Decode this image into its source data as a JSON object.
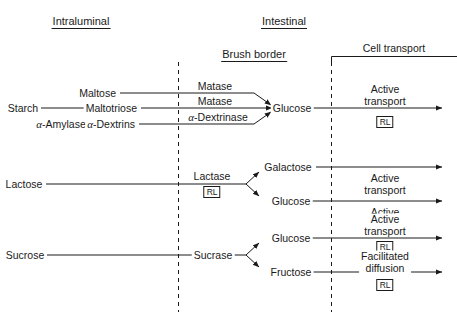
{
  "diagram": {
    "headers": {
      "intraluminal": "Intraluminal",
      "intestinal": "Intestinal",
      "brush_border": "Brush border",
      "cell_transport": "Cell transport"
    },
    "colors": {
      "line": "#1a1a1a",
      "text": "#1a1a1a",
      "background": "#ffffff"
    },
    "substrates": {
      "starch": "Starch",
      "lactose": "Lactose",
      "sucrose": "Sucrose"
    },
    "luminal_enzyme": {
      "alpha": "α",
      "name": "-Amylase"
    },
    "starch_products": {
      "maltose": "Maltose",
      "maltotriose": "Maltotriose",
      "alpha_dextrins_alpha": "α",
      "alpha_dextrins_name": "-Dextrins"
    },
    "brush_border_enzymes": {
      "maltase_1": "Matase",
      "maltase_2": "Matase",
      "alpha_dextrinase_alpha": "α",
      "alpha_dextrinase_name": "-Dextrinase",
      "lactase": "Lactase",
      "sucrase": "Sucrase"
    },
    "monosaccharides": {
      "glucose_starch": "Glucose",
      "galactose_lactose": "Galactose",
      "glucose_lactose": "Glucose",
      "glucose_sucrose": "Glucose",
      "fructose_sucrose": "Fructose"
    },
    "transport_mechanisms": {
      "starch_glucose_line1": "Active",
      "starch_glucose_line2": "transport",
      "lactose_shared_line1": "Active",
      "lactose_shared_line2": "transport",
      "lactose_glucose_line1": "Active",
      "lactose_glucose_line2": "transport",
      "sucrose_glucose_line1": "Active",
      "sucrose_glucose_line2": "transport",
      "sucrose_fructose_line1": "Facilitated",
      "sucrose_fructose_line2": "diffusion"
    },
    "rl_markers": {
      "label": "RL",
      "meaning_count": 4,
      "positions": [
        "starch-glucose-transport",
        "lactase-enzyme",
        "sucrose-glucose-transport",
        "sucrose-fructose-transport"
      ]
    }
  }
}
